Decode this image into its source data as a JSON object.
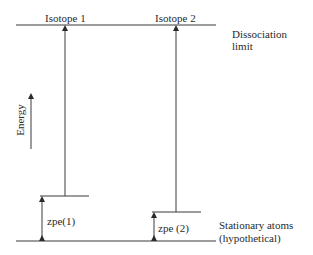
{
  "diagram": {
    "labels": {
      "isotope1": "Isotope 1",
      "isotope2": "Isotope 2",
      "dissociation_line1": "Dissociation",
      "dissociation_line2": "limit",
      "energy_axis": "Energy",
      "zpe1": "zpe(1)",
      "zpe2": "zpe (2)",
      "stationary_line1": "Stationary atoms",
      "stationary_line2": "(hypothetical)"
    },
    "levels": {
      "dissociation_limit_y": 25,
      "zpe1_level_y": 196,
      "zpe2_level_y": 212,
      "ground_y": 241
    },
    "colors": {
      "line": "#3a3a3a",
      "background": "#ffffff"
    }
  }
}
